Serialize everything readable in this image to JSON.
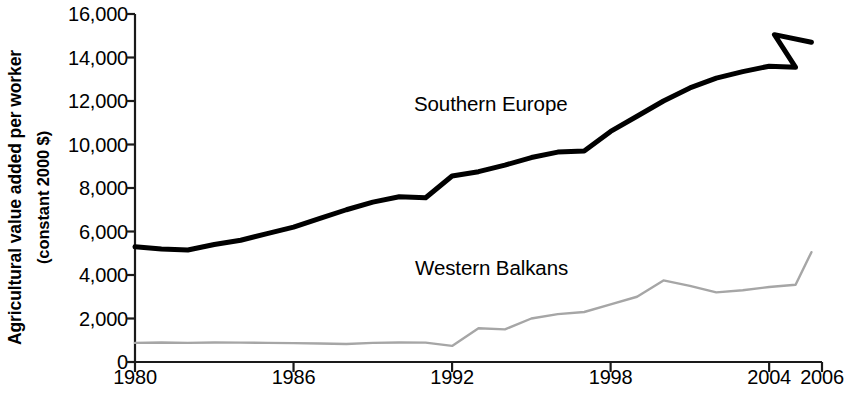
{
  "chart_data": {
    "type": "line",
    "title": "",
    "xlabel": "",
    "ylabel": "Agricultural value added per worker (constant 2000 $)",
    "ylabel_line1": "Agricultural value added per worker",
    "ylabel_line2": "(constant 2000 $)",
    "xlim": [
      1980,
      2006
    ],
    "ylim": [
      0,
      16000
    ],
    "grid": false,
    "legend_position": "inline-annotations",
    "x_ticks": [
      1980,
      1986,
      1992,
      1998,
      2004,
      2006
    ],
    "x_tick_labels": [
      "1980",
      "1986",
      "1992",
      "1998",
      "2004",
      "2006"
    ],
    "y_ticks": [
      0,
      2000,
      4000,
      6000,
      8000,
      10000,
      12000,
      14000,
      16000
    ],
    "y_tick_labels": [
      "0",
      "2,000",
      "4,000",
      "6,000",
      "8,000",
      "10,000",
      "12,000",
      "14,000",
      "16,000"
    ],
    "x": [
      1980,
      1981,
      1982,
      1983,
      1984,
      1985,
      1986,
      1987,
      1988,
      1989,
      1990,
      1991,
      1992,
      1993,
      1994,
      1995,
      1996,
      1997,
      1998,
      1999,
      2000,
      2001,
      2002,
      2003,
      2004,
      2005
    ],
    "series": [
      {
        "name": "Southern Europe",
        "color": "#000000",
        "values": [
          5300,
          5200,
          5150,
          5400,
          5600,
          5900,
          6200,
          6600,
          7000,
          7350,
          7600,
          7550,
          8550,
          8750,
          9050,
          9400,
          9650,
          9700,
          10600,
          11300,
          12000,
          12600,
          13050,
          13350,
          13600,
          13550
        ]
      },
      {
        "name": "Western Balkans",
        "color": "#a6a6a6",
        "values": [
          880,
          900,
          880,
          900,
          890,
          880,
          870,
          850,
          830,
          880,
          900,
          890,
          740,
          1550,
          1500,
          2000,
          2200,
          2300,
          2650,
          3000,
          3750,
          3500,
          3200,
          3300,
          3450,
          3550
        ]
      }
    ],
    "extra_points": {
      "southern_europe_2004_peak": 15050,
      "southern_europe_2005_end": 14700,
      "western_balkans_2005_end": 5050
    },
    "annotations": [
      {
        "text": "Southern Europe",
        "x": 1990.5,
        "y": 11800
      },
      {
        "text": "Western Balkans",
        "x": 1990.5,
        "y": 4450
      }
    ]
  },
  "axis": {
    "y_title_line1": "Agricultural value added per worker",
    "y_title_line2": "(constant 2000 $)"
  },
  "labels": {
    "southern_europe": "Southern Europe",
    "western_balkans": "Western Balkans"
  }
}
